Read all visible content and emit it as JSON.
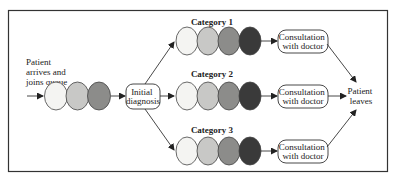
{
  "diagram": {
    "entry": {
      "label_lines": [
        "Patient",
        "arrives and",
        "joins queue"
      ]
    },
    "entry_queue": {
      "colors": [
        "#f4f4f2",
        "#c8c8c6",
        "#8c8c8a"
      ]
    },
    "initial_diagnosis": {
      "label_lines": [
        "Initial",
        "diagnosis"
      ]
    },
    "categories": [
      {
        "label": "Category 1",
        "queue_colors": [
          "#f4f4f2",
          "#c8c8c6",
          "#8c8c8a",
          "#3a3a3a"
        ],
        "consultation_lines": [
          "Consultation",
          "with doctor"
        ]
      },
      {
        "label": "Category 2",
        "queue_colors": [
          "#f4f4f2",
          "#c8c8c6",
          "#8c8c8a",
          "#3a3a3a"
        ],
        "consultation_lines": [
          "Consultation",
          "with doctor"
        ]
      },
      {
        "label": "Category 3",
        "queue_colors": [
          "#f4f4f2",
          "#c8c8c6",
          "#8c8c8a",
          "#3a3a3a"
        ],
        "consultation_lines": [
          "Consultation",
          "with doctor"
        ]
      }
    ],
    "exit": {
      "label_lines": [
        "Patient",
        "leaves"
      ]
    }
  }
}
